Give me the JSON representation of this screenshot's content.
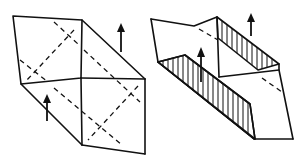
{
  "figure": {
    "panels": [
      {
        "id": "step-1",
        "content": "folded prism with dashed crease diagonals and two up arrows"
      },
      {
        "id": "step-2",
        "content": "prism opened with hatched inner flaps and two up arrows"
      }
    ],
    "colors": {
      "ink": "#111111",
      "paper": "#ffffff"
    }
  }
}
